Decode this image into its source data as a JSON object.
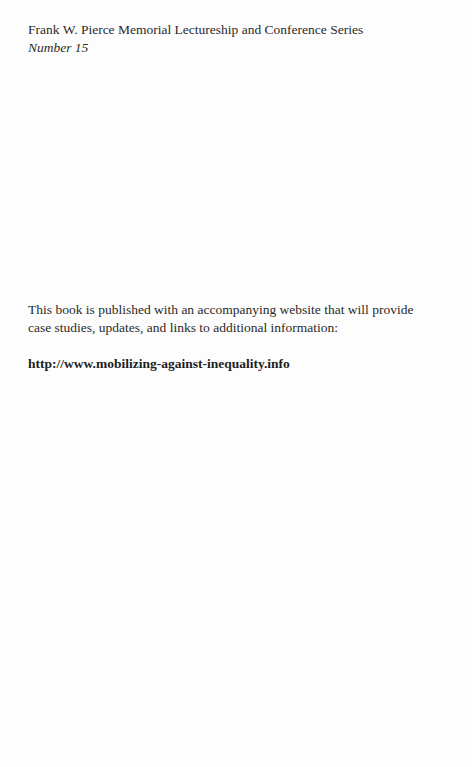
{
  "series": {
    "title": "Frank W. Pierce Memorial Lectureship and Conference Series",
    "number": "Number 15"
  },
  "notice": {
    "line1": "This book is published with an accompanying website that will provide",
    "line2": "case studies, updates, and links to additional information:"
  },
  "website": {
    "url": "http://www.mobilizing-against-inequality.info"
  }
}
